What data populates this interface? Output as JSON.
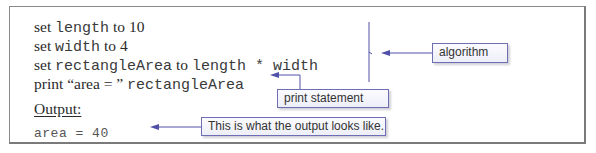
{
  "code": {
    "lines": [
      {
        "parts": [
          {
            "text": "set ",
            "style": "serif"
          },
          {
            "text": "length",
            "style": "mono"
          },
          {
            "text": " to 10",
            "style": "serif"
          }
        ]
      },
      {
        "parts": [
          {
            "text": "set ",
            "style": "serif"
          },
          {
            "text": "width",
            "style": "mono"
          },
          {
            "text": " to 4",
            "style": "serif"
          }
        ]
      },
      {
        "parts": [
          {
            "text": "set ",
            "style": "serif"
          },
          {
            "text": "rectangleArea",
            "style": "mono"
          },
          {
            "text": " to ",
            "style": "serif"
          },
          {
            "text": "length * width",
            "style": "mono"
          }
        ]
      },
      {
        "parts": [
          {
            "text": "print “area = ” ",
            "style": "serif"
          },
          {
            "text": "rectangleArea",
            "style": "mono"
          }
        ]
      }
    ],
    "output_label": "Output:",
    "output_value": "area = 40"
  },
  "callouts": {
    "algorithm": "algorithm",
    "print_statement": "print statement",
    "output_note": "This is what the output looks like."
  },
  "colors": {
    "connector": "#5050a8",
    "callout_border": "#6e6eb4",
    "frame_border": "#8a8a8a"
  }
}
